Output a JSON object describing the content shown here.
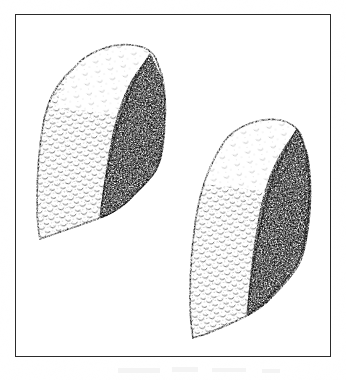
{
  "plate": {
    "kind": "scientific-illustration-plate",
    "medium": "pen-and-ink stipple drawing",
    "subject": "two fossil shell specimens in oblique view",
    "background_color": "#ffffff",
    "ink_color": "#2b2b2b",
    "frame": {
      "present": true,
      "color": "#2b2b2b",
      "thickness_px": 1.4,
      "left": 15,
      "top": 14,
      "width": 316,
      "height": 343
    },
    "caption": "",
    "figure_number": "",
    "scale_bar": ""
  },
  "specimens": [
    {
      "id": "specimen-left",
      "label": "",
      "position": "upper-left",
      "bounds": {
        "left": 36,
        "top": 43,
        "right": 162,
        "bottom": 263
      },
      "orientation": "apex upper-right, tilted left",
      "faces": [
        {
          "name": "light-face",
          "side": "left",
          "shading": "sparse crescent-scale stipple",
          "tone": "light"
        },
        {
          "name": "dark-face",
          "side": "right",
          "shading": "dense dot stipple",
          "tone": "dark"
        }
      ],
      "outline_style": "broken dotted contour"
    },
    {
      "id": "specimen-right",
      "label": "",
      "position": "lower-right",
      "bounds": {
        "left": 186,
        "top": 117,
        "right": 307,
        "bottom": 338
      },
      "orientation": "apex upper-right, tilted left",
      "faces": [
        {
          "name": "light-face",
          "side": "left",
          "shading": "sparse crescent-scale stipple",
          "tone": "light"
        },
        {
          "name": "dark-face",
          "side": "right",
          "shading": "dense dot stipple",
          "tone": "dark"
        }
      ],
      "outline_style": "broken dotted contour"
    }
  ],
  "artifacts": {
    "scan_smudges_below_frame": 4,
    "paper_tone": "#fdfdfd"
  }
}
